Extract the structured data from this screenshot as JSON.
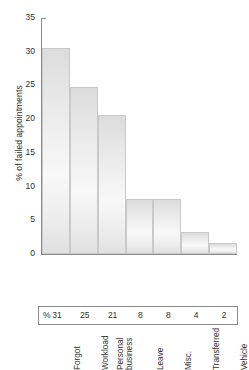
{
  "chart_data": {
    "type": "bar",
    "title": "",
    "subtitle": "",
    "xlabel": "",
    "ylabel": "% of failed appointments",
    "categories": [
      "Forgot",
      "Workload",
      "Personal business",
      "Leave",
      "Misc.",
      "Transferred",
      "Vehicle"
    ],
    "category_lines": [
      [
        "Forgot"
      ],
      [
        "Workload"
      ],
      [
        "Personal",
        "business"
      ],
      [
        "Leave"
      ],
      [
        "Misc."
      ],
      [
        "Transferred"
      ],
      [
        "Vehicle"
      ]
    ],
    "values": [
      30.5,
      24.7,
      20.6,
      8.2,
      8.2,
      3.2,
      1.6
    ],
    "ylim": [
      0,
      35
    ],
    "yticks": [
      0,
      5,
      10,
      15,
      20,
      25,
      30,
      35
    ],
    "ytick_labels": [
      "0",
      "5",
      "10",
      "15",
      "20",
      "25",
      "30",
      "35"
    ],
    "grid": false,
    "legend": false,
    "bar_fill_top": "#dcdcdc",
    "bar_fill_mid": "#f8f8f8",
    "bar_border": "#c9c9c9",
    "axis_color": "#8b8b8b"
  },
  "data_table": {
    "row_prefix": "%",
    "values": [
      "31",
      "25",
      "21",
      "8",
      "8",
      "4",
      "2"
    ]
  }
}
